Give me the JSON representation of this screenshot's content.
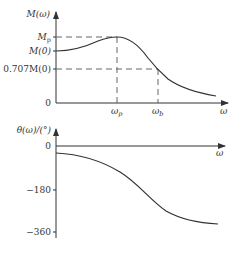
{
  "top_plot": {
    "y_axis_label": "M(ω)",
    "x_axis_label": "ω",
    "y_ticks": [
      {
        "label": "Mp",
        "y": 37
      },
      {
        "label": "M(0)",
        "y": 51
      },
      {
        "label": "0.707M(0)",
        "y": 69
      },
      {
        "label": "0",
        "y": 103
      }
    ],
    "x_ticks": [
      {
        "label": "ωp",
        "x": 117
      },
      {
        "label": "ωb",
        "x": 158
      }
    ],
    "mp_label_main": "M",
    "mp_label_sub": "p",
    "m0_label": "M(0)",
    "m707_label": "0.707M(0)",
    "zero_label": "0",
    "wp_main": "ω",
    "wp_sub": "p",
    "wb_main": "ω",
    "wb_sub": "b"
  },
  "bottom_plot": {
    "y_axis_label": "θ(ω)/(°)",
    "x_axis_label": "ω",
    "y_ticks": [
      {
        "label": "0",
        "y": 146
      },
      {
        "label": "−180",
        "y": 190
      },
      {
        "label": "−360",
        "y": 232
      }
    ],
    "zero_label": "0",
    "m180_label": "−180",
    "m360_label": "−360"
  },
  "colors": {
    "curve": "#333333",
    "axis": "#333333",
    "dashed": "#555555"
  }
}
